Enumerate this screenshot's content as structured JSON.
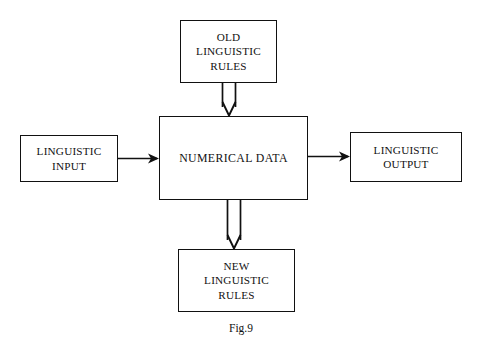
{
  "figure": {
    "caption": "Fig.9",
    "background_color": "#ffffff",
    "ink_color": "#111111"
  },
  "nodes": {
    "old_rules": {
      "label": "OLD\nLINGUISTIC\nRULES"
    },
    "center": {
      "label": "NUMERICAL DATA"
    },
    "input": {
      "label": "LINGUISTIC\nINPUT"
    },
    "output": {
      "label": "LINGUISTIC\nOUTPUT"
    },
    "new_rules": {
      "label": "NEW\nLINGUISTIC\nRULES"
    }
  },
  "connectors": [
    {
      "name": "old-rules-to-numerical-data",
      "from": "old_rules",
      "to": "center",
      "style": "double-line-open-shaft",
      "arrowhead": "open-v",
      "direction": "down"
    },
    {
      "name": "linguistic-input-to-numerical-data",
      "from": "input",
      "to": "center",
      "style": "single-line",
      "arrowhead": "solid",
      "direction": "right"
    },
    {
      "name": "numerical-data-to-linguistic-output",
      "from": "center",
      "to": "output",
      "style": "single-line",
      "arrowhead": "solid",
      "direction": "right"
    },
    {
      "name": "numerical-data-to-new-rules",
      "from": "center",
      "to": "new_rules",
      "style": "double-line-open-shaft",
      "arrowhead": "open-v",
      "direction": "down"
    }
  ]
}
